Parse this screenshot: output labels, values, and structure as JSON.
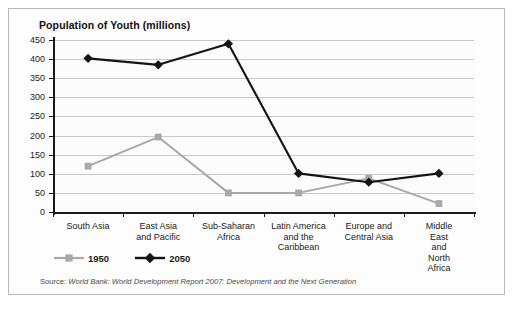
{
  "figure": {
    "title": "Population of Youth (millions)",
    "source_lead": "Source:",
    "source_body": "World Bank: World Development Report 2007: Development and the Next Generation",
    "colors": {
      "series_1950": "#a8a8a8",
      "series_2050": "#141414",
      "axis": "#1b1b1b",
      "gridline": "#c9c9c9",
      "frame": "#b9b9b9",
      "background": "#fdfdfd"
    }
  },
  "chart_data": {
    "type": "line",
    "title": "Population of Youth (millions)",
    "xlabel": "",
    "ylabel": "",
    "ylim": [
      0,
      450
    ],
    "yticks": [
      0,
      50,
      100,
      150,
      200,
      250,
      300,
      350,
      400,
      450
    ],
    "ytick_labels": [
      "0",
      "50",
      "100",
      "150",
      "200",
      "250",
      "300",
      "350",
      "400",
      "450"
    ],
    "grid": true,
    "legend_position": "below-axis-left",
    "categories": [
      "South Asia",
      "East Asia\nand Pacific",
      "Sub-Saharan\nAfrica",
      "Latin America\nand the\nCaribbean",
      "Europe and\nCentral Asia",
      "Middle East\nand North\nAfrica"
    ],
    "series": [
      {
        "name": "1950",
        "marker": "square",
        "color": "#a8a8a8",
        "values": [
          120,
          196,
          50,
          50,
          88,
          22
        ]
      },
      {
        "name": "2050",
        "marker": "diamond",
        "color": "#141414",
        "values": [
          402,
          385,
          440,
          101,
          78,
          101
        ]
      }
    ]
  }
}
